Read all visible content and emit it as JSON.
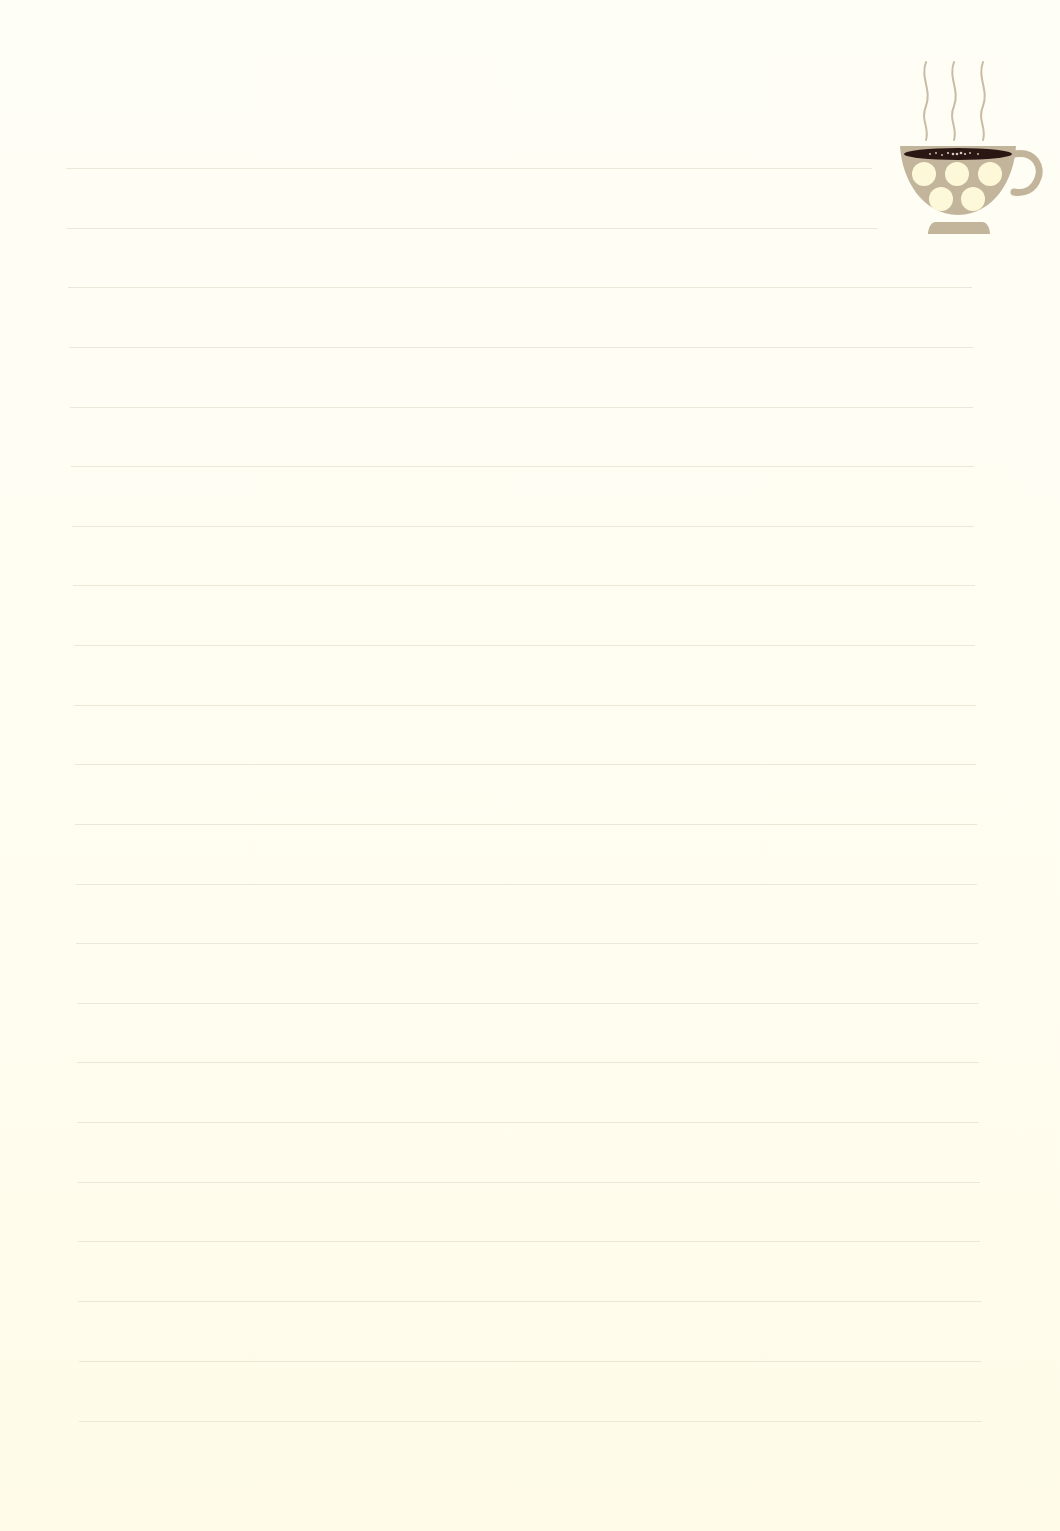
{
  "page": {
    "type": "lined-notepaper",
    "background_color": "#fffdf2",
    "rule_color": "#e9e4d3"
  },
  "lines": [
    {
      "y": 168,
      "x1": 66,
      "x2": 872
    },
    {
      "y": 228,
      "x1": 67,
      "x2": 878
    },
    {
      "y": 287,
      "x1": 68,
      "x2": 972
    },
    {
      "y": 347,
      "x1": 69,
      "x2": 973
    },
    {
      "y": 407,
      "x1": 70,
      "x2": 973
    },
    {
      "y": 466,
      "x1": 71,
      "x2": 974
    },
    {
      "y": 526,
      "x1": 72,
      "x2": 974
    },
    {
      "y": 585,
      "x1": 73,
      "x2": 975
    },
    {
      "y": 645,
      "x1": 74,
      "x2": 975
    },
    {
      "y": 705,
      "x1": 74,
      "x2": 976
    },
    {
      "y": 764,
      "x1": 75,
      "x2": 976
    },
    {
      "y": 824,
      "x1": 75,
      "x2": 977
    },
    {
      "y": 884,
      "x1": 76,
      "x2": 977
    },
    {
      "y": 943,
      "x1": 76,
      "x2": 978
    },
    {
      "y": 1003,
      "x1": 77,
      "x2": 978
    },
    {
      "y": 1062,
      "x1": 77,
      "x2": 979
    },
    {
      "y": 1122,
      "x1": 77,
      "x2": 979
    },
    {
      "y": 1182,
      "x1": 78,
      "x2": 980
    },
    {
      "y": 1241,
      "x1": 78,
      "x2": 980
    },
    {
      "y": 1301,
      "x1": 78,
      "x2": 981
    },
    {
      "y": 1361,
      "x1": 79,
      "x2": 981
    },
    {
      "y": 1421,
      "x1": 79,
      "x2": 982
    }
  ],
  "decoration": {
    "icon": "coffee-cup-icon",
    "cup_color": "#c2b59b",
    "dot_color": "#fdf8d8",
    "coffee_color": "#2a1714",
    "steam_color": "#c9bca4",
    "steam_count": 3,
    "dot_count": 5
  }
}
